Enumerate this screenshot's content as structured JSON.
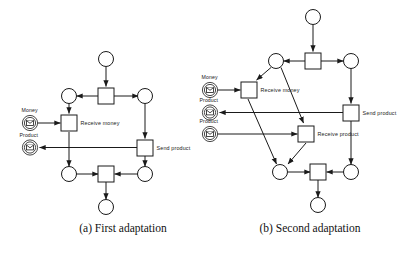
{
  "figure": {
    "type": "petri-net-diagram-pair",
    "background": "#ffffff",
    "stroke_color": "#1a1a1a",
    "captions": {
      "a": "(a) First adaptation",
      "b": "(b) Second adaptation"
    }
  },
  "diagram_a": {
    "id": "first-adaptation",
    "transition_labels": {
      "receive_money": "Receive money",
      "send_product": "Send product"
    },
    "port_labels": {
      "money": "Money",
      "product": "Product"
    },
    "icons": {
      "money_envelope": "envelope-icon",
      "product_envelope": "envelope-icon"
    }
  },
  "diagram_b": {
    "id": "second-adaptation",
    "transition_labels": {
      "receive_money": "Receive money",
      "send_product": "Send product",
      "receive_product": "Receive product"
    },
    "port_labels": {
      "money": "Money",
      "product_out": "Product",
      "product_in": "Product"
    },
    "icons": {
      "money_envelope": "envelope-icon",
      "product_out_envelope": "envelope-icon",
      "product_in_envelope": "envelope-icon"
    }
  }
}
